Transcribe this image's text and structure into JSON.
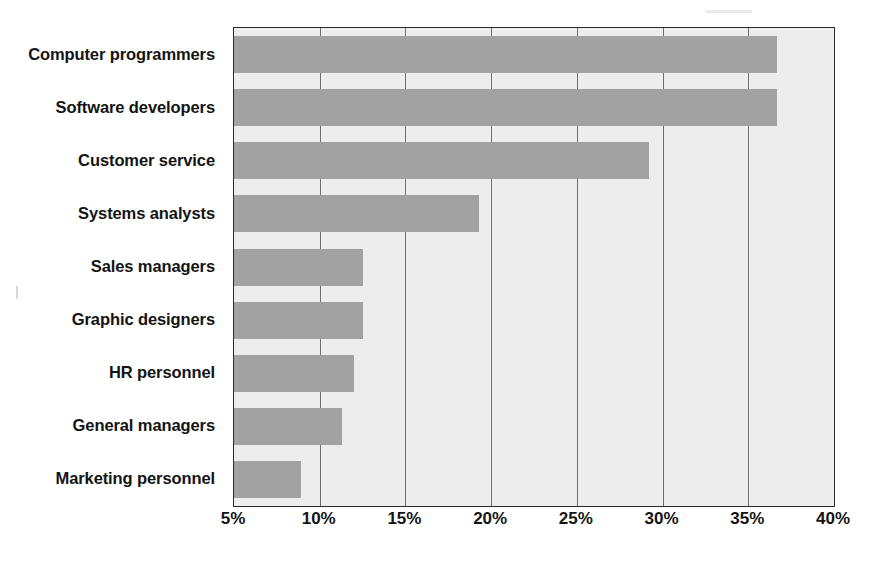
{
  "chart_data": {
    "type": "bar",
    "orientation": "horizontal",
    "title": "",
    "subtitle": "",
    "xlabel": "",
    "ylabel": "",
    "categories": [
      "Computer programmers",
      "Software developers",
      "Customer service",
      "Systems analysts",
      "Sales managers",
      "Graphic designers",
      "HR personnel",
      "General managers",
      "Marketing personnel"
    ],
    "values": [
      36.7,
      36.7,
      29.2,
      19.3,
      12.5,
      12.5,
      12.0,
      11.3,
      8.9
    ],
    "value_suffix": "%",
    "xlim": [
      5,
      40
    ],
    "xticks": [
      5,
      10,
      15,
      20,
      25,
      30,
      35,
      40
    ],
    "xticklabels": [
      "5%",
      "10%",
      "15%",
      "20%",
      "25%",
      "30%",
      "35%",
      "40%"
    ],
    "grid": "vertical",
    "legend": "none",
    "colors": {
      "bar_fill": "#a2a2a2",
      "plot_background": "#ededed",
      "axis_line": "#2b2b2b",
      "gridline": "#6e6e6e",
      "text": "#141414",
      "page_background": "#ffffff"
    }
  }
}
